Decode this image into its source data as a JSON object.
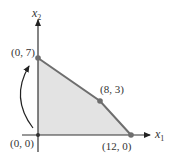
{
  "diagram": {
    "type": "feasible-region",
    "axes": {
      "x_label": "x",
      "x_subscript": "1",
      "y_label": "x",
      "y_subscript": "2"
    },
    "vertices": [
      {
        "label": "(0, 0)",
        "x": 0,
        "y": 0
      },
      {
        "label": "(0, 7)",
        "x": 0,
        "y": 7
      },
      {
        "label": "(8, 3)",
        "x": 8,
        "y": 3
      },
      {
        "label": "(12, 0)",
        "x": 12,
        "y": 0
      }
    ],
    "colors": {
      "region_fill": "#e3e3e3",
      "boundary": "#6e6e6e",
      "axis": "#333333",
      "vertex_dot": "#6e6e6e"
    },
    "annotation": "curved arrow from (0, 0) to (0, 7)"
  }
}
